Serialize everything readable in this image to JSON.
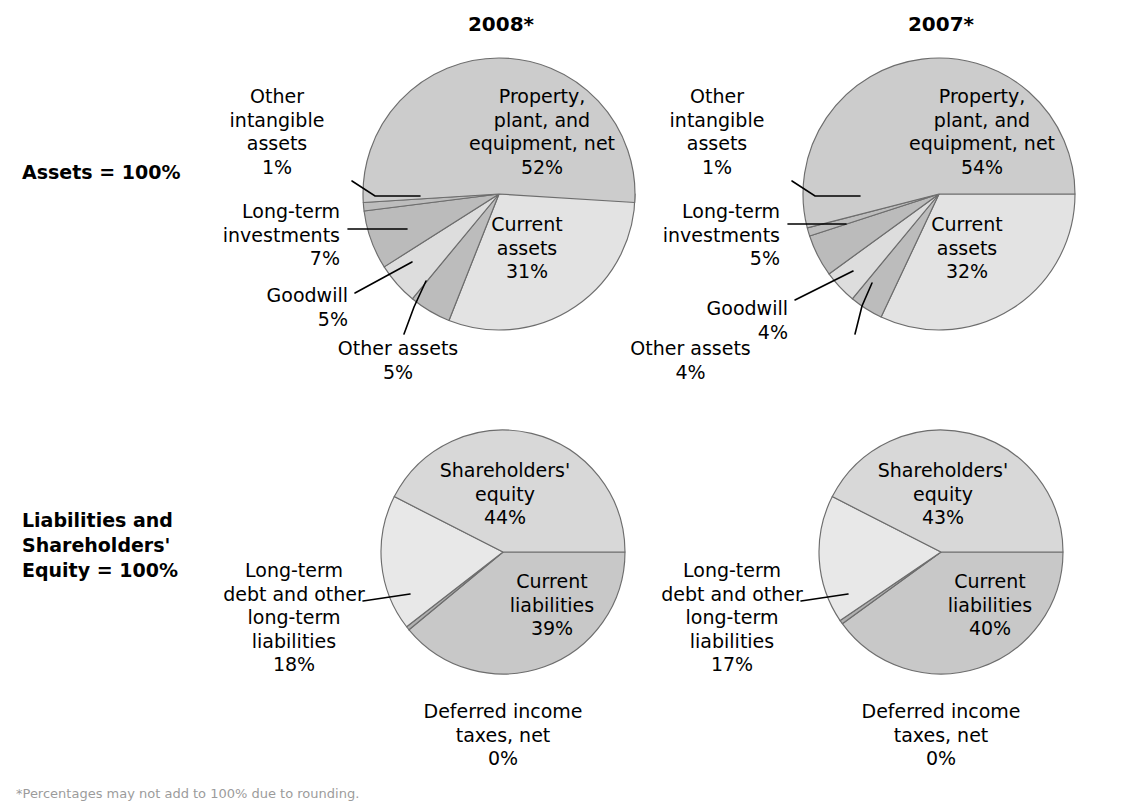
{
  "row_labels": [
    {
      "name": "assets-row-label",
      "text": "Assets = 100%",
      "x": 22,
      "y": 160
    },
    {
      "name": "liabilities-row-label",
      "text": "Liabilities and\nShareholders'\nEquity = 100%",
      "x": 22,
      "y": 508
    }
  ],
  "footnote": "*Percentages may not add to 100% due to rounding.",
  "colors": {
    "ppe": "#cccccc",
    "current_assets": "#e3e3e3",
    "other_intangible": "#bdbdbd",
    "long_term_investments": "#bbbbbb",
    "goodwill": "#dddddd",
    "other_assets": "#bcbcbc",
    "shareholders_equity": "#d8d8d8",
    "current_liabilities": "#c8c8c8",
    "long_term_debt": "#e8e8e8",
    "deferred_taxes": "#b0b0b0",
    "outline": "#6d6d6d",
    "text": "#000000"
  },
  "charts": [
    {
      "id": "assets-2008",
      "title": "2008*",
      "title_x": 421,
      "title_y": 12,
      "cx": 499,
      "cy": 194,
      "r": 136,
      "start_angle": 0,
      "direction": "clockwise",
      "slices": [
        {
          "name": "current-assets",
          "label": "Current\nassets",
          "pct": 31,
          "value_text": "31%",
          "color_key": "current_assets",
          "placement": "inside",
          "lx": 472,
          "ly": 213,
          "lw": 110
        },
        {
          "name": "other-assets",
          "label": "Other assets",
          "pct": 5,
          "value_text": "5%",
          "color_key": "other_assets",
          "placement": "outside",
          "lx": 318,
          "ly": 337,
          "lw": 160,
          "align": "center",
          "leader": "M 404 334 L 414 307 L 426 281"
        },
        {
          "name": "goodwill",
          "label": "Goodwill",
          "pct": 5,
          "value_text": "5%",
          "color_key": "goodwill",
          "placement": "outside",
          "lx": 208,
          "ly": 284,
          "lw": 140,
          "align": "right",
          "leader": "M 355 293 L 412 262"
        },
        {
          "name": "long-term-investments",
          "label": "Long-term\ninvestments",
          "pct": 7,
          "value_text": "7%",
          "color_key": "long_term_investments",
          "placement": "outside",
          "lx": 172,
          "ly": 200,
          "lw": 168,
          "align": "right",
          "leader": "M 348 229 L 407 229"
        },
        {
          "name": "other-intangible-assets",
          "label": "Other\nintangible\nassets",
          "pct": 1,
          "value_text": "1%",
          "color_key": "other_intangible",
          "placement": "outside",
          "lx": 214,
          "ly": 85,
          "lw": 126,
          "align": "center",
          "leader": "M 352 181 L 375 196 L 420 196"
        },
        {
          "name": "property-plant-equipment",
          "label": "Property,\nplant, and\nequipment, net",
          "pct": 52,
          "value_text": "52%",
          "color_key": "ppe",
          "placement": "inside",
          "lx": 447,
          "ly": 85,
          "lw": 190
        }
      ]
    },
    {
      "id": "assets-2007",
      "title": "2007*",
      "title_x": 861,
      "title_y": 12,
      "cx": 939,
      "cy": 194,
      "r": 136,
      "start_angle": 0,
      "direction": "clockwise",
      "slices": [
        {
          "name": "current-assets",
          "label": "Current\nassets",
          "pct": 32,
          "value_text": "32%",
          "color_key": "current_assets",
          "placement": "inside",
          "lx": 912,
          "ly": 213,
          "lw": 110
        },
        {
          "name": "other-assets",
          "label": "Other assets",
          "pct": 4,
          "value_text": "4%",
          "color_key": "other_assets",
          "placement": "outside",
          "lx": 598,
          "ly": 337,
          "lw": 185,
          "align": "center",
          "leader": "M 855 334 L 862 306 L 872 283"
        },
        {
          "name": "goodwill",
          "label": "Goodwill",
          "pct": 4,
          "value_text": "4%",
          "color_key": "goodwill",
          "placement": "outside",
          "lx": 648,
          "ly": 297,
          "lw": 140,
          "align": "right",
          "leader": "M 795 300 L 853 271"
        },
        {
          "name": "long-term-investments",
          "label": "Long-term\ninvestments",
          "pct": 5,
          "value_text": "5%",
          "color_key": "long_term_investments",
          "placement": "outside",
          "lx": 612,
          "ly": 200,
          "lw": 168,
          "align": "right",
          "leader": "M 788 224 L 846 224"
        },
        {
          "name": "other-intangible-assets",
          "label": "Other\nintangible\nassets",
          "pct": 1,
          "value_text": "1%",
          "color_key": "other_intangible",
          "placement": "outside",
          "lx": 654,
          "ly": 85,
          "lw": 126,
          "align": "center",
          "leader": "M 792 181 L 815 196 L 860 196"
        },
        {
          "name": "property-plant-equipment",
          "label": "Property,\nplant, and\nequipment, net",
          "pct": 54,
          "value_text": "54%",
          "color_key": "ppe",
          "placement": "inside",
          "lx": 887,
          "ly": 85,
          "lw": 190
        }
      ]
    },
    {
      "id": "liabilities-2008",
      "title": "",
      "cx": 503,
      "cy": 552,
      "r": 122,
      "start_angle": 0,
      "direction": "clockwise",
      "slices": [
        {
          "name": "current-liabilities",
          "label": "Current\nliabilities",
          "pct": 39,
          "value_text": "39%",
          "color_key": "current_liabilities",
          "placement": "inside",
          "lx": 492,
          "ly": 570,
          "lw": 120
        },
        {
          "name": "deferred-income-taxes",
          "label": "Deferred income\ntaxes, net",
          "pct": 0.5,
          "value_text": "0%",
          "color_key": "deferred_taxes",
          "placement": "outside",
          "lx": 393,
          "ly": 700,
          "lw": 220,
          "align": "center",
          "leader": ""
        },
        {
          "name": "long-term-debt",
          "label": "Long-term\ndebt and other\nlong-term\nliabilities",
          "pct": 18,
          "value_text": "18%",
          "color_key": "long_term_debt",
          "placement": "outside",
          "lx": 214,
          "ly": 559,
          "lw": 160,
          "align": "center",
          "leader": "M 363 601 L 410 594"
        },
        {
          "name": "shareholders-equity",
          "label": "Shareholders'\nequity",
          "pct": 42.5,
          "value_text": "44%",
          "color_key": "shareholders_equity",
          "placement": "inside",
          "lx": 425,
          "ly": 459,
          "lw": 160
        }
      ]
    },
    {
      "id": "liabilities-2007",
      "title": "",
      "cx": 941,
      "cy": 552,
      "r": 122,
      "start_angle": 0,
      "direction": "clockwise",
      "slices": [
        {
          "name": "current-liabilities",
          "label": "Current\nliabilities",
          "pct": 40,
          "value_text": "40%",
          "color_key": "current_liabilities",
          "placement": "inside",
          "lx": 930,
          "ly": 570,
          "lw": 120
        },
        {
          "name": "deferred-income-taxes",
          "label": "Deferred income\ntaxes, net",
          "pct": 0.5,
          "value_text": "0%",
          "color_key": "deferred_taxes",
          "placement": "outside",
          "lx": 831,
          "ly": 700,
          "lw": 220,
          "align": "center",
          "leader": ""
        },
        {
          "name": "long-term-debt",
          "label": "Long-term\ndebt and other\nlong-term\nliabilities",
          "pct": 17,
          "value_text": "17%",
          "color_key": "long_term_debt",
          "placement": "outside",
          "lx": 652,
          "ly": 559,
          "lw": 160,
          "align": "center",
          "leader": "M 801 601 L 848 594"
        },
        {
          "name": "shareholders-equity",
          "label": "Shareholders'\nequity",
          "pct": 42.5,
          "value_text": "43%",
          "color_key": "shareholders_equity",
          "placement": "inside",
          "lx": 863,
          "ly": 459,
          "lw": 160
        }
      ]
    }
  ],
  "chart_data": [
    {
      "type": "pie",
      "title": "2008*",
      "group": "Assets = 100%",
      "categories": [
        "Property, plant, and equipment, net",
        "Current assets",
        "Other assets",
        "Goodwill",
        "Long-term investments",
        "Other intangible assets"
      ],
      "values": [
        52,
        31,
        5,
        5,
        7,
        1
      ],
      "unit": "%",
      "legend": "inline-labels"
    },
    {
      "type": "pie",
      "title": "2007*",
      "group": "Assets = 100%",
      "categories": [
        "Property, plant, and equipment, net",
        "Current assets",
        "Other assets",
        "Goodwill",
        "Long-term investments",
        "Other intangible assets"
      ],
      "values": [
        54,
        32,
        4,
        4,
        5,
        1
      ],
      "unit": "%",
      "legend": "inline-labels"
    },
    {
      "type": "pie",
      "title": "2008*",
      "group": "Liabilities and Shareholders' Equity = 100%",
      "categories": [
        "Shareholders' equity",
        "Current liabilities",
        "Long-term debt and other long-term liabilities",
        "Deferred income taxes, net"
      ],
      "values": [
        44,
        39,
        18,
        0
      ],
      "unit": "%",
      "legend": "inline-labels"
    },
    {
      "type": "pie",
      "title": "2007*",
      "group": "Liabilities and Shareholders' Equity = 100%",
      "categories": [
        "Shareholders' equity",
        "Current liabilities",
        "Long-term debt and other long-term liabilities",
        "Deferred income taxes, net"
      ],
      "values": [
        43,
        40,
        17,
        0
      ],
      "unit": "%",
      "legend": "inline-labels"
    }
  ]
}
